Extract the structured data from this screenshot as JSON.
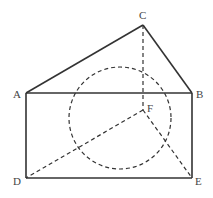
{
  "diagram": {
    "type": "geometry-figure",
    "points": {
      "A": {
        "label": "A",
        "x": 26,
        "y": 93
      },
      "B": {
        "label": "B",
        "x": 192,
        "y": 93
      },
      "C": {
        "label": "C",
        "x": 143,
        "y": 25
      },
      "D": {
        "label": "D",
        "x": 26,
        "y": 178
      },
      "E": {
        "label": "E",
        "x": 192,
        "y": 178
      },
      "F": {
        "label": "F",
        "x": 143,
        "y": 110
      }
    },
    "solid_segments": [
      "AB",
      "BE",
      "ED",
      "DA",
      "AC",
      "CB"
    ],
    "dashed_segments": [
      "CF",
      "FD",
      "FE"
    ],
    "dashed_circle": {
      "cx": 120,
      "cy": 118,
      "r": 51
    },
    "colors": {
      "line": "#333333",
      "label": "#444444",
      "background": "#ffffff"
    }
  }
}
